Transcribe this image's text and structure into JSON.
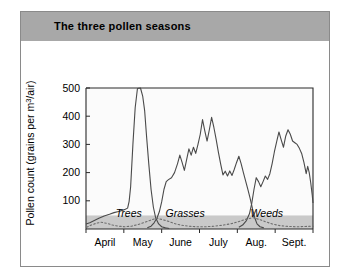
{
  "title": "The three pollen seasons",
  "chart_data": {
    "type": "line",
    "title": "The three pollen seasons",
    "xlabel": "",
    "ylabel": "Pollen count (grains per m³/air)",
    "ylim": [
      0,
      500
    ],
    "yticks": [
      100,
      200,
      300,
      400,
      500
    ],
    "ytick_labels": [
      "100",
      "200",
      "300",
      "400",
      "500"
    ],
    "xlim": [
      0,
      6
    ],
    "xtick_labels": [
      "April",
      "May",
      "June",
      "July",
      "Aug.",
      "Sept."
    ],
    "grid": false,
    "legend": "inline-annotations",
    "annotations": [
      "Trees",
      "Grasses",
      "Weeds"
    ],
    "series": [
      {
        "name": "Trees",
        "label_x": 1.13,
        "label_y": 42,
        "points": [
          [
            0.0,
            18
          ],
          [
            0.1,
            22
          ],
          [
            0.22,
            30
          ],
          [
            0.34,
            38
          ],
          [
            0.48,
            46
          ],
          [
            0.62,
            52
          ],
          [
            0.74,
            58
          ],
          [
            0.86,
            62
          ],
          [
            0.96,
            66
          ],
          [
            1.04,
            70
          ],
          [
            1.1,
            74
          ],
          [
            1.14,
            98
          ],
          [
            1.18,
            150
          ],
          [
            1.24,
            300
          ],
          [
            1.3,
            430
          ],
          [
            1.36,
            498
          ],
          [
            1.44,
            500
          ],
          [
            1.5,
            470
          ],
          [
            1.55,
            420
          ],
          [
            1.6,
            330
          ],
          [
            1.66,
            230
          ],
          [
            1.72,
            140
          ],
          [
            1.78,
            78
          ],
          [
            1.84,
            40
          ],
          [
            1.92,
            18
          ],
          [
            2.0,
            8
          ],
          [
            2.1,
            4
          ],
          [
            2.2,
            2
          ]
        ]
      },
      {
        "name": "Grasses",
        "label_x": 2.62,
        "label_y": 42,
        "points": [
          [
            1.62,
            4
          ],
          [
            1.72,
            10
          ],
          [
            1.8,
            22
          ],
          [
            1.88,
            40
          ],
          [
            1.94,
            62
          ],
          [
            2.0,
            96
          ],
          [
            2.06,
            140
          ],
          [
            2.12,
            168
          ],
          [
            2.18,
            175
          ],
          [
            2.26,
            182
          ],
          [
            2.34,
            200
          ],
          [
            2.42,
            232
          ],
          [
            2.48,
            262
          ],
          [
            2.54,
            236
          ],
          [
            2.6,
            208
          ],
          [
            2.66,
            246
          ],
          [
            2.72,
            284
          ],
          [
            2.78,
            262
          ],
          [
            2.84,
            290
          ],
          [
            2.9,
            268
          ],
          [
            2.96,
            300
          ],
          [
            3.02,
            336
          ],
          [
            3.08,
            388
          ],
          [
            3.14,
            348
          ],
          [
            3.2,
            312
          ],
          [
            3.26,
            352
          ],
          [
            3.32,
            396
          ],
          [
            3.38,
            360
          ],
          [
            3.44,
            318
          ],
          [
            3.5,
            272
          ],
          [
            3.56,
            230
          ],
          [
            3.62,
            192
          ],
          [
            3.68,
            205
          ],
          [
            3.74,
            188
          ],
          [
            3.8,
            206
          ],
          [
            3.86,
            190
          ],
          [
            3.92,
            212
          ],
          [
            3.98,
            236
          ],
          [
            4.04,
            258
          ],
          [
            4.1,
            232
          ],
          [
            4.16,
            200
          ],
          [
            4.22,
            170
          ],
          [
            4.28,
            140
          ],
          [
            4.34,
            108
          ],
          [
            4.4,
            72
          ],
          [
            4.46,
            40
          ],
          [
            4.52,
            18
          ],
          [
            4.6,
            8
          ],
          [
            4.7,
            4
          ]
        ]
      },
      {
        "name": "Weeds",
        "label_x": 4.78,
        "label_y": 42,
        "points": [
          [
            4.04,
            6
          ],
          [
            4.14,
            14
          ],
          [
            4.24,
            30
          ],
          [
            4.32,
            54
          ],
          [
            4.38,
            90
          ],
          [
            4.44,
            140
          ],
          [
            4.5,
            182
          ],
          [
            4.56,
            168
          ],
          [
            4.62,
            150
          ],
          [
            4.68,
            168
          ],
          [
            4.74,
            188
          ],
          [
            4.8,
            176
          ],
          [
            4.86,
            196
          ],
          [
            4.92,
            232
          ],
          [
            4.98,
            274
          ],
          [
            5.04,
            310
          ],
          [
            5.1,
            344
          ],
          [
            5.16,
            316
          ],
          [
            5.22,
            290
          ],
          [
            5.28,
            330
          ],
          [
            5.34,
            352
          ],
          [
            5.4,
            336
          ],
          [
            5.46,
            312
          ],
          [
            5.52,
            306
          ],
          [
            5.58,
            300
          ],
          [
            5.64,
            286
          ],
          [
            5.7,
            268
          ],
          [
            5.76,
            236
          ],
          [
            5.82,
            196
          ],
          [
            5.86,
            222
          ],
          [
            5.9,
            200
          ],
          [
            5.94,
            164
          ],
          [
            5.98,
            120
          ],
          [
            6.0,
            92
          ]
        ]
      }
    ],
    "baseline_band": {
      "name": "low-count-band",
      "value_top": 48,
      "value_bottom": 0,
      "color": "#c9c9c9"
    },
    "dotted_overlay": {
      "name": "pollen-threshold-dotted",
      "points": [
        [
          0.02,
          6
        ],
        [
          0.14,
          14
        ],
        [
          0.26,
          20
        ],
        [
          0.4,
          24
        ],
        [
          0.55,
          20
        ],
        [
          0.7,
          14
        ],
        [
          0.86,
          10
        ],
        [
          1.02,
          8
        ],
        [
          1.2,
          10
        ],
        [
          1.38,
          16
        ],
        [
          1.56,
          24
        ],
        [
          1.72,
          32
        ],
        [
          1.86,
          38
        ],
        [
          2.0,
          34
        ],
        [
          2.16,
          28
        ],
        [
          2.32,
          20
        ],
        [
          2.5,
          14
        ],
        [
          2.7,
          10
        ],
        [
          2.92,
          8
        ],
        [
          3.16,
          8
        ],
        [
          3.4,
          10
        ],
        [
          3.64,
          14
        ],
        [
          3.88,
          20
        ],
        [
          4.08,
          28
        ],
        [
          4.26,
          36
        ],
        [
          4.42,
          40
        ],
        [
          4.58,
          34
        ],
        [
          4.74,
          26
        ],
        [
          4.92,
          18
        ],
        [
          5.12,
          12
        ],
        [
          5.34,
          9
        ],
        [
          5.58,
          8
        ],
        [
          5.8,
          9
        ],
        [
          6.0,
          10
        ]
      ]
    }
  }
}
